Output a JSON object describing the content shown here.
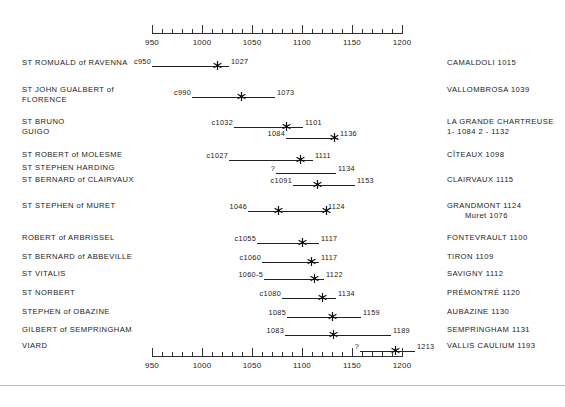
{
  "chart_data": {
    "type": "timeline",
    "title": "",
    "xlabel": "",
    "ylabel": "",
    "xlim": [
      950,
      1200
    ],
    "major_tick_step": 50,
    "minor_tick_step": 10,
    "grid": false,
    "legend": "none",
    "axis_ticks": [
      {
        "value": 950,
        "label": "950"
      },
      {
        "value": 1000,
        "label": "1000"
      },
      {
        "value": 1050,
        "label": "1050"
      },
      {
        "value": 1100,
        "label": "1100"
      },
      {
        "value": 1150,
        "label": "1150"
      },
      {
        "value": 1200,
        "label": "1200"
      }
    ],
    "axis_top_y": 33,
    "axis_bottom_y": 356,
    "rows": [
      {
        "left_label": "ST ROMUALD of RAVENNA",
        "left_label_2": "",
        "right_label": "CAMALDOLI  1015",
        "right_label_2": "",
        "right_label_indent": "",
        "y": 58,
        "bars": [
          {
            "start": 950,
            "end": 1027,
            "start_label": "c950",
            "end_label": "1027",
            "stars": [
              1015
            ],
            "y": 58
          }
        ]
      },
      {
        "left_label": "ST JOHN GUALBERT of",
        "left_label_2": "FLORENCE",
        "right_label": "VALLOMBROSA  1039",
        "right_label_2": "",
        "right_label_indent": "",
        "y": 85,
        "bars": [
          {
            "start": 990,
            "end": 1073,
            "start_label": "c990",
            "end_label": "1073",
            "stars": [
              1039
            ],
            "y": 89
          }
        ]
      },
      {
        "left_label": "ST BRUNO",
        "left_label_2": "GUIGO",
        "right_label": "LA GRANDE CHARTREUSE",
        "right_label_2": "1- 1084    2 - 1132",
        "right_label_indent": "",
        "y": 117,
        "bars": [
          {
            "start": 1032,
            "end": 1101,
            "start_label": "c1032",
            "end_label": "1101",
            "stars": [
              1084
            ],
            "y": 119
          },
          {
            "start": 1084,
            "end": 1136,
            "start_label": "1084",
            "end_label": "1136",
            "stars": [
              1132
            ],
            "y": 130
          }
        ]
      },
      {
        "left_label": "ST ROBERT of MOLESME",
        "left_label_2": "",
        "right_label": "CÎTEAUX  1098",
        "right_label_2": "",
        "right_label_indent": "",
        "y": 150,
        "bars": [
          {
            "start": 1027,
            "end": 1111,
            "start_label": "c1027",
            "end_label": "1111",
            "stars": [
              1098
            ],
            "y": 152
          }
        ]
      },
      {
        "left_label": "ST STEPHEN HARDING",
        "left_label_2": "",
        "right_label": "",
        "right_label_2": "",
        "right_label_indent": "",
        "y": 163,
        "bars": [
          {
            "start": 1074,
            "end": 1134,
            "start_label": "?",
            "end_label": "1134",
            "stars": [],
            "y": 165
          }
        ]
      },
      {
        "left_label": "ST BERNARD of CLAIRVAUX",
        "left_label_2": "",
        "right_label": "CLAIRVAUX  1115",
        "right_label_2": "",
        "right_label_indent": "",
        "y": 175,
        "bars": [
          {
            "start": 1091,
            "end": 1153,
            "start_label": "c1091",
            "end_label": "1153",
            "stars": [
              1115
            ],
            "y": 177
          }
        ]
      },
      {
        "left_label": "ST STEPHEN of MURET",
        "left_label_2": "",
        "right_label": "GRANDMONT  1124",
        "right_label_2": "",
        "right_label_indent": "Muret 1076",
        "y": 201,
        "bars": [
          {
            "start": 1046,
            "end": 1124,
            "start_label": "1046",
            "end_label": "1124",
            "stars": [
              1076,
              1124
            ],
            "y": 203
          }
        ]
      },
      {
        "left_label": "ROBERT of ARBRISSEL",
        "left_label_2": "",
        "right_label": "FONTEVRAULT  1100",
        "right_label_2": "",
        "right_label_indent": "",
        "y": 233,
        "bars": [
          {
            "start": 1055,
            "end": 1117,
            "start_label": "c1055",
            "end_label": "1117",
            "stars": [
              1100
            ],
            "y": 235
          }
        ]
      },
      {
        "left_label": "ST BERNARD of ABBEVILLE",
        "left_label_2": "",
        "right_label": "TIRON  1109",
        "right_label_2": "",
        "right_label_indent": "",
        "y": 252,
        "bars": [
          {
            "start": 1060,
            "end": 1117,
            "start_label": "c1060",
            "end_label": "1117",
            "stars": [
              1109
            ],
            "y": 254
          }
        ]
      },
      {
        "left_label": "ST VITALIS",
        "left_label_2": "",
        "right_label": "SAVIGNY  1112",
        "right_label_2": "",
        "right_label_indent": "",
        "y": 269,
        "bars": [
          {
            "start": 1062,
            "end": 1122,
            "start_label": "1060-5",
            "end_label": "1122",
            "stars": [
              1112
            ],
            "y": 271
          }
        ]
      },
      {
        "left_label": "ST NORBERT",
        "left_label_2": "",
        "right_label": "PRÉMONTRÉ  1120",
        "right_label_2": "",
        "right_label_indent": "",
        "y": 288,
        "bars": [
          {
            "start": 1080,
            "end": 1134,
            "start_label": "c1080",
            "end_label": "1134",
            "stars": [
              1120
            ],
            "y": 290
          }
        ]
      },
      {
        "left_label": "STEPHEN of OBAZINE",
        "left_label_2": "",
        "right_label": "AUBAZINE  1130",
        "right_label_2": "",
        "right_label_indent": "",
        "y": 307,
        "bars": [
          {
            "start": 1085,
            "end": 1159,
            "start_label": "1085",
            "end_label": "1159",
            "stars": [
              1130
            ],
            "y": 309
          }
        ]
      },
      {
        "left_label": "GILBERT of SEMPRINGHAM",
        "left_label_2": "",
        "right_label": "SEMPRINGHAM  1131",
        "right_label_2": "",
        "right_label_indent": "",
        "y": 325,
        "bars": [
          {
            "start": 1083,
            "end": 1189,
            "start_label": "1083",
            "end_label": "1189",
            "stars": [
              1131
            ],
            "y": 327
          }
        ]
      },
      {
        "left_label": "VIARD",
        "left_label_2": "",
        "right_label": "VALLIS CAULIUM  1193",
        "right_label_2": "",
        "right_label_indent": "",
        "y": 341,
        "bars": [
          {
            "start": 1158,
            "end": 1213,
            "start_label": "?",
            "end_label": "1213",
            "stars": [
              1193
            ],
            "y": 343
          }
        ]
      }
    ]
  },
  "colors": {
    "line": "#222222",
    "text": "#1a1a1a",
    "rule": "#b9b9b9",
    "background": "#ffffff"
  }
}
